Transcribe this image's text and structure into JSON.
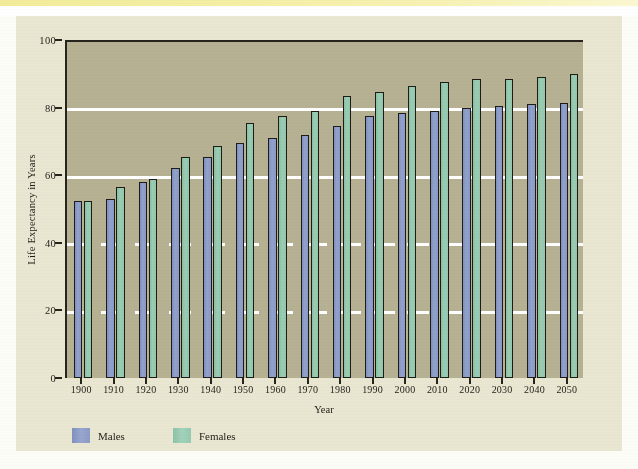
{
  "figure": {
    "background_color": "#e9e6d2",
    "plot_background_color": "#b7b193",
    "axis_color": "#26241c",
    "gridline_color": "#ffffff"
  },
  "legend": {
    "position": "bottom-left",
    "items": [
      {
        "label": "Males",
        "color": "#8c9bc7"
      },
      {
        "label": "Females",
        "color": "#95cab0"
      }
    ]
  },
  "chart_data": {
    "type": "bar",
    "title": "",
    "xlabel": "Year",
    "ylabel": "Life Expectancy in Years",
    "ylim": [
      0,
      100
    ],
    "yticks": [
      0,
      20,
      40,
      60,
      80,
      100
    ],
    "grid": true,
    "grid_axis": "y",
    "legend_position": "bottom-left",
    "categories": [
      "1900",
      "1910",
      "1920",
      "1930",
      "1940",
      "1950",
      "1960",
      "1970",
      "1980",
      "1990",
      "2000",
      "2010",
      "2020",
      "2030",
      "2040",
      "2050"
    ],
    "series": [
      {
        "name": "Males",
        "color": "#8c9bc7",
        "values": [
          52.5,
          53.0,
          58.0,
          62.0,
          65.5,
          69.5,
          71.0,
          72.0,
          74.5,
          77.5,
          78.5,
          79.0,
          80.0,
          80.5,
          81.0,
          81.5
        ]
      },
      {
        "name": "Females",
        "color": "#95cab0",
        "values": [
          52.3,
          56.5,
          59.0,
          65.5,
          68.5,
          75.5,
          77.5,
          79.0,
          83.5,
          84.5,
          86.5,
          87.5,
          88.5,
          88.5,
          89.0,
          90.0
        ]
      }
    ]
  }
}
